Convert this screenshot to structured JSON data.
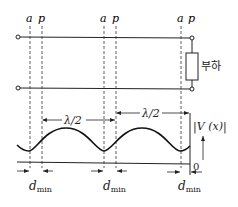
{
  "diagram": {
    "point_labels": {
      "a": "a",
      "p": "p"
    },
    "load_label": "부하",
    "half_wavelength_label": "λ/2",
    "voltage_label": "|V (x)|",
    "origin_label": "0",
    "dmin_label_main": "d",
    "dmin_label_sub": "min",
    "colors": {
      "line": "#222222",
      "background": "#ffffff"
    }
  }
}
